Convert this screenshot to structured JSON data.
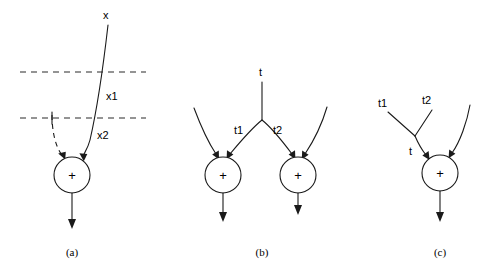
{
  "figure": {
    "background_color": "#ffffff",
    "stroke_color": "#1a1a1a",
    "panels": [
      {
        "id": "a",
        "caption": "(a)",
        "caption_x": 72,
        "caption_y": 253,
        "node_symbol": "+",
        "node_cx": 72,
        "node_cy": 175,
        "node_r": 18,
        "labels": [
          {
            "name": "x",
            "text": "x",
            "x": 103,
            "y": 16
          },
          {
            "name": "x1",
            "text": "x1",
            "x": 106,
            "y": 97
          },
          {
            "name": "x2",
            "text": "x2",
            "x": 97,
            "y": 136
          }
        ],
        "guides": [
          {
            "name": "upper-threshold",
            "x1": 20,
            "y1": 72,
            "x2": 146,
            "y2": 72
          },
          {
            "name": "lower-threshold",
            "x1": 20,
            "y1": 118,
            "x2": 146,
            "y2": 118
          }
        ]
      },
      {
        "id": "b",
        "caption": "(b)",
        "caption_x": 262,
        "caption_y": 253,
        "node_symbol": "+",
        "nodes": [
          {
            "name": "left-adder",
            "cx": 223,
            "cy": 175,
            "r": 18
          },
          {
            "name": "right-adder",
            "cx": 298,
            "cy": 175,
            "r": 18
          }
        ],
        "labels": [
          {
            "name": "t",
            "text": "t",
            "x": 259,
            "y": 73
          },
          {
            "name": "t1",
            "text": "t1",
            "x": 234,
            "y": 131
          },
          {
            "name": "t2",
            "text": "t2",
            "x": 273,
            "y": 131
          }
        ]
      },
      {
        "id": "c",
        "caption": "(c)",
        "caption_x": 440,
        "caption_y": 253,
        "node_symbol": "+",
        "node_cx": 440,
        "node_cy": 173,
        "node_r": 18,
        "labels": [
          {
            "name": "t1",
            "text": "t1",
            "x": 378,
            "y": 104
          },
          {
            "name": "t2",
            "text": "t2",
            "x": 422,
            "y": 101
          },
          {
            "name": "t",
            "text": "t",
            "x": 409,
            "y": 152
          }
        ]
      }
    ]
  }
}
